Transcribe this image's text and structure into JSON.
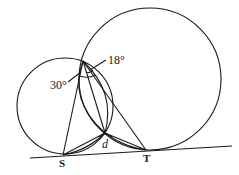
{
  "diagram": {
    "type": "geometry",
    "stroke_color": "#1a1a1a",
    "labels": {
      "point_s": "S",
      "point_t": "T",
      "angle_30": "30°",
      "angle_18": "18°",
      "angle_d": "d"
    },
    "points": {
      "S": [
        63,
        155
      ],
      "T": [
        146,
        150
      ],
      "A": [
        83,
        61
      ],
      "B": [
        105,
        133
      ]
    },
    "circles": [
      {
        "name": "small-circle",
        "cx": 65,
        "cy": 106,
        "r": 48
      },
      {
        "name": "large-circle",
        "cx": 150,
        "cy": 79,
        "r": 71
      }
    ],
    "tangent_line": {
      "x1": 30,
      "y1": 158,
      "x2": 232,
      "y2": 146
    }
  }
}
